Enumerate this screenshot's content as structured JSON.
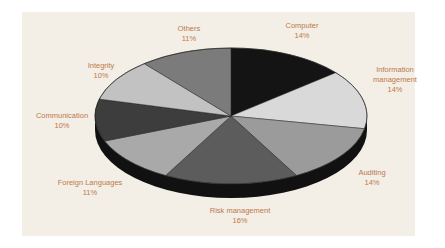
{
  "chart_data": {
    "type": "pie",
    "style": "3d-exploded-none",
    "title": "",
    "slices": [
      {
        "label": "Computer",
        "value": 14,
        "pct_label": "14%",
        "color": "#141414"
      },
      {
        "label": "Information management",
        "label_lines": [
          "Information",
          "management"
        ],
        "value": 14,
        "pct_label": "14%",
        "color": "#d9d9d9"
      },
      {
        "label": "Auditing",
        "value": 14,
        "pct_label": "14%",
        "color": "#9b9b9b"
      },
      {
        "label": "Risk management",
        "value": 16,
        "pct_label": "16%",
        "color": "#5c5c5c"
      },
      {
        "label": "Foreign Languages",
        "value": 11,
        "pct_label": "11%",
        "color": "#a9a9a9"
      },
      {
        "label": "Communication",
        "value": 10,
        "pct_label": "10%",
        "color": "#3d3d3d"
      },
      {
        "label": "Integrity",
        "value": 10,
        "pct_label": "10%",
        "color": "#c2c2c2"
      },
      {
        "label": "Others",
        "value": 11,
        "pct_label": "11%",
        "color": "#7b7b7b"
      }
    ],
    "label_color": "#c0784a",
    "background": "#f3efe6",
    "legend": "none"
  }
}
